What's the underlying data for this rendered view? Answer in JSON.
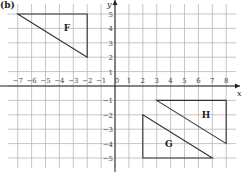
{
  "part_label": "(b)",
  "axes": {
    "x_label": "x",
    "y_label": "y",
    "x_range": [
      -7,
      8
    ],
    "y_range": [
      -5,
      5
    ],
    "x_ticks": [
      "−7",
      "−6",
      "−5",
      "−4",
      "−3",
      "−2",
      "−1",
      "0",
      "1",
      "2",
      "3",
      "4",
      "5",
      "6",
      "7",
      "8"
    ],
    "y_ticks": [
      "5",
      "4",
      "3",
      "2",
      "1",
      "−1",
      "−2",
      "−3",
      "−4",
      "−5"
    ]
  },
  "shapes": [
    {
      "name": "F",
      "vertices": [
        [
          -7,
          5
        ],
        [
          -2,
          5
        ],
        [
          -2,
          2
        ]
      ]
    },
    {
      "name": "G",
      "vertices": [
        [
          2,
          -2
        ],
        [
          2,
          -5
        ],
        [
          7,
          -5
        ]
      ]
    },
    {
      "name": "H",
      "vertices": [
        [
          3,
          -1
        ],
        [
          8,
          -1
        ],
        [
          8,
          -4
        ]
      ]
    }
  ],
  "colors": {
    "grid": "#b8b8b8",
    "axis": "#222222",
    "shape": "#333333"
  }
}
